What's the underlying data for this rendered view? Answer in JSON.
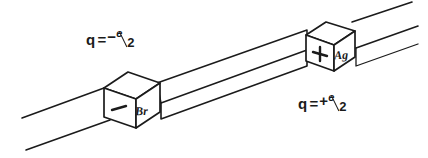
{
  "figure": {
    "background_color": "#ffffff",
    "ink_color": "#1b1b1b"
  },
  "labels": {
    "left_charge": {
      "variable": "q",
      "equals": "=",
      "sign": "−",
      "numerator": "e",
      "denominator": "2",
      "full_text": "q = -e/2"
    },
    "right_charge": {
      "variable": "q",
      "equals": "=",
      "sign": "+",
      "numerator": "e",
      "denominator": "2",
      "full_text": "q = +e/2"
    }
  },
  "cubes": [
    {
      "id": "left-cube",
      "front_face_symbol": "–",
      "front_face_symbol_name": "minus-sign",
      "side_face_label": "Br",
      "charge_label": "q = -e/2"
    },
    {
      "id": "right-cube",
      "front_face_symbol": "+",
      "front_face_symbol_name": "plus-sign",
      "side_face_label": "Ag",
      "charge_label": "q = +e/2"
    }
  ]
}
